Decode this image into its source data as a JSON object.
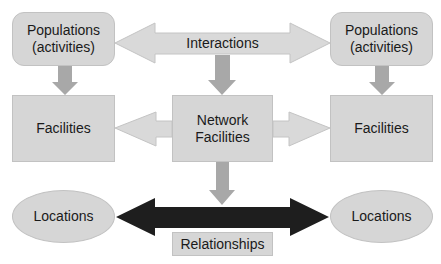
{
  "diagram": {
    "nodes": {
      "populations_left": "Populations\n(activities)",
      "populations_right": "Populations\n(activities)",
      "facilities_left": "Facilities",
      "network_facilities": "Network\nFacilities",
      "facilities_right": "Facilities",
      "locations_left": "Locations",
      "locations_right": "Locations"
    },
    "labels": {
      "interactions": "Interactions",
      "relationships": "Relationships"
    },
    "edges": [
      {
        "from": "Interactions",
        "to": "Populations (activities) left",
        "type": "light-arrow"
      },
      {
        "from": "Interactions",
        "to": "Populations (activities) right",
        "type": "light-arrow"
      },
      {
        "from": "Interactions",
        "to": "Network Facilities",
        "type": "down-arrow"
      },
      {
        "from": "Populations (activities) left",
        "to": "Facilities left",
        "type": "down-arrow"
      },
      {
        "from": "Populations (activities) right",
        "to": "Facilities right",
        "type": "down-arrow"
      },
      {
        "from": "Network Facilities",
        "to": "Facilities left",
        "type": "light-arrow"
      },
      {
        "from": "Network Facilities",
        "to": "Facilities right",
        "type": "light-arrow"
      },
      {
        "from": "Network Facilities",
        "to": "Relationships",
        "type": "down-arrow"
      },
      {
        "from": "Relationships",
        "to": "Locations left",
        "type": "dark-arrow"
      },
      {
        "from": "Relationships",
        "to": "Locations right",
        "type": "dark-arrow"
      }
    ],
    "colors": {
      "node_fill": "#d6d6d6",
      "light_arrow": "#d9d9d9",
      "down_arrow": "#a8a8a8",
      "dark_arrow": "#1e1e1e"
    }
  }
}
